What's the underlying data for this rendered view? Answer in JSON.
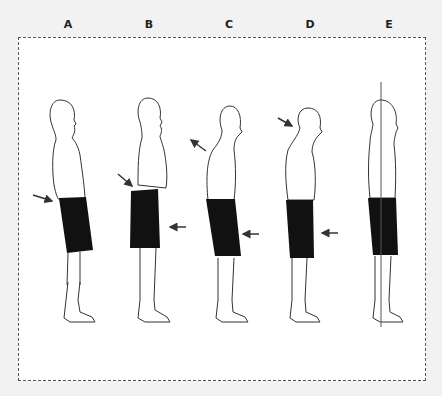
{
  "diagram": {
    "type": "posture-comparison",
    "figures": [
      {
        "label": "A",
        "description": "Lordotic posture",
        "arrows": [
          "lower-back"
        ]
      },
      {
        "label": "B",
        "description": "Sway-back / flat back",
        "arrows": [
          "lower-back",
          "front-hip"
        ]
      },
      {
        "label": "C",
        "description": "Forward head / thoracic",
        "arrows": [
          "upper-back",
          "front-hip"
        ]
      },
      {
        "label": "D",
        "description": "Kyphotic posture",
        "arrows": [
          "upper-back",
          "front-hip"
        ]
      },
      {
        "label": "E",
        "description": "Ideal posture with plumb line",
        "arrows": []
      }
    ],
    "colors": {
      "background": "#f2f2f2",
      "panel": "#ffffff",
      "outline": "#333333",
      "shorts": "#111111",
      "arrow": "#333333"
    }
  }
}
